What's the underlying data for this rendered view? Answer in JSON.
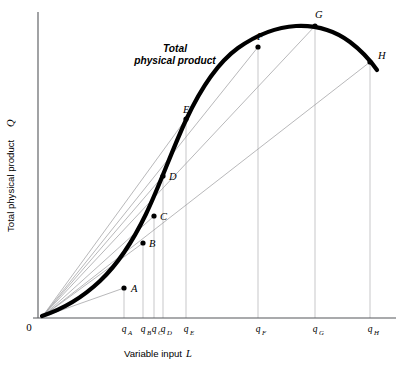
{
  "chart_data": {
    "type": "line",
    "title": "",
    "annotation": {
      "line1": "Total",
      "line2": "physical product",
      "x": 175,
      "y": 52
    },
    "xlabel_text": "Variable input",
    "xlabel_symbol": "L",
    "ylabel_text": "Total physical product",
    "ylabel_symbol": "Q",
    "origin_label": "0",
    "grid": false,
    "legend": "none",
    "axes": {
      "x_start_px": 38,
      "x_end_px": 396,
      "y_top_px": 12,
      "y_base_px": 318
    },
    "xlim": [
      0,
      10
    ],
    "ylim": [
      0,
      10
    ],
    "series": [
      {
        "name": "Total physical product",
        "comment": "cubic production function Q = a*L^2 - b*L^3 style curve",
        "path_px": "M 42,316 C 60,310 82,298 100,281 C 118,264 132,243 146,214 C 160,185 172,150 186,120 C 200,90 216,64 238,48 C 258,34 278,27 296,26 C 316,25 334,30 350,42 C 362,51 370,60 377,70"
      }
    ],
    "points": [
      {
        "label": "A",
        "x_px": 124,
        "y_px": 288,
        "label_dx": 7,
        "label_dy": 4,
        "q": "q",
        "sub": "A",
        "tick_x_px": 124
      },
      {
        "label": "B",
        "x_px": 143,
        "y_px": 243,
        "label_dx": 6,
        "label_dy": 4,
        "q": "q",
        "sub": "B",
        "tick_x_px": 143
      },
      {
        "label": "C",
        "x_px": 154,
        "y_px": 216,
        "label_dx": 6,
        "label_dy": 4,
        "q": "q",
        "sub": "C",
        "tick_x_px": 154
      },
      {
        "label": "D",
        "x_px": 163,
        "y_px": 176,
        "label_dx": 6,
        "label_dy": 4,
        "q": "q",
        "sub": "D",
        "tick_x_px": 163
      },
      {
        "label": "E",
        "x_px": 186,
        "y_px": 119,
        "label_dx": -3,
        "label_dy": -6,
        "q": "q",
        "sub": "E",
        "tick_x_px": 186
      },
      {
        "label": "F",
        "x_px": 258,
        "y_px": 47,
        "label_dx": -1,
        "label_dy": -7,
        "q": "q",
        "sub": "F",
        "tick_x_px": 258
      },
      {
        "label": "G",
        "x_px": 315,
        "y_px": 26,
        "label_dx": 0,
        "label_dy": -8,
        "q": "q",
        "sub": "G",
        "tick_x_px": 315
      },
      {
        "label": "H",
        "x_px": 370,
        "y_px": 62,
        "label_dx": 8,
        "label_dy": -3,
        "q": "q",
        "sub": "H",
        "tick_x_px": 370
      }
    ],
    "rays_from_origin": [
      {
        "to": "A",
        "x_px": 124,
        "y_px": 288
      },
      {
        "to": "B",
        "x_px": 143,
        "y_px": 243
      },
      {
        "to": "C",
        "x_px": 154,
        "y_px": 216
      },
      {
        "to": "D",
        "x_px": 163,
        "y_px": 176
      },
      {
        "to": "E",
        "x_px": 186,
        "y_px": 119
      },
      {
        "to": "F",
        "x_px": 258,
        "y_px": 47
      },
      {
        "to": "G",
        "x_px": 315,
        "y_px": 26
      },
      {
        "to": "H",
        "x_px": 370,
        "y_px": 62
      }
    ],
    "origin_px": {
      "x": 42,
      "y": 317
    }
  }
}
